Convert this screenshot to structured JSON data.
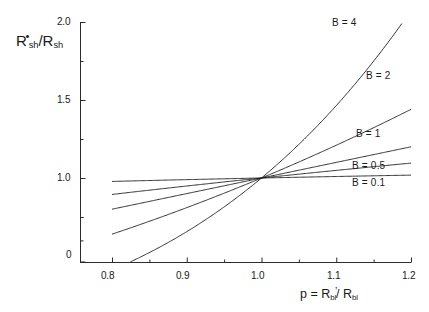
{
  "chart_data": {
    "type": "line",
    "title": "",
    "subtitle": "",
    "xlabel": "p = R'bl / Rbl",
    "ylabel": "R*sh / Rsh",
    "xlim": [
      0.8,
      1.2
    ],
    "ylim": [
      0.0,
      2.0
    ],
    "grid": false,
    "legend_position": "inline-right-of-curves",
    "x_ticks_major": [
      "0.8",
      "0.9",
      "1.0",
      "1.1",
      "1.2"
    ],
    "x_tick_values": [
      0.8,
      0.9,
      1.0,
      1.1,
      1.2
    ],
    "x_minor_ticks": [
      0.85,
      0.95,
      1.05,
      1.15
    ],
    "y_ticks_major": [
      "0",
      "1.0",
      "1.5",
      "2.0"
    ],
    "y_tick_values": [
      0.48,
      1.0,
      1.5,
      2.0
    ],
    "y_minor_ticks": [
      0.75,
      1.25,
      1.75
    ],
    "crossing_point": {
      "x": 1.0,
      "y": 1.0
    },
    "series": [
      {
        "name": "B = 0.1",
        "exponent": 0.1,
        "label": "B = 0.1",
        "x": [
          0.8,
          0.85,
          0.9,
          0.95,
          1.0,
          1.05,
          1.1,
          1.15,
          1.2
        ],
        "values": [
          0.978,
          0.984,
          0.99,
          0.995,
          1.0,
          1.005,
          1.01,
          1.014,
          1.018
        ]
      },
      {
        "name": "B = 0.5",
        "exponent": 0.5,
        "label": "B = 0.5",
        "x": [
          0.8,
          0.85,
          0.9,
          0.95,
          1.0,
          1.05,
          1.1,
          1.15,
          1.2
        ],
        "values": [
          0.894,
          0.922,
          0.949,
          0.975,
          1.0,
          1.025,
          1.049,
          1.072,
          1.095
        ]
      },
      {
        "name": "B = 1",
        "exponent": 1.0,
        "label": "B = 1",
        "x": [
          0.8,
          0.85,
          0.9,
          0.95,
          1.0,
          1.05,
          1.1,
          1.15,
          1.2
        ],
        "values": [
          0.8,
          0.85,
          0.9,
          0.95,
          1.0,
          1.05,
          1.1,
          1.15,
          1.2
        ]
      },
      {
        "name": "B = 2",
        "exponent": 2.0,
        "label": "B = 2",
        "x": [
          0.8,
          0.85,
          0.9,
          0.95,
          1.0,
          1.05,
          1.1,
          1.15,
          1.2
        ],
        "values": [
          0.64,
          0.723,
          0.81,
          0.903,
          1.0,
          1.103,
          1.21,
          1.323,
          1.44
        ]
      },
      {
        "name": "B = 4",
        "exponent": 4.0,
        "label": "B = 4",
        "x": [
          0.8,
          0.85,
          0.9,
          0.95,
          1.0,
          1.05,
          1.1,
          1.108
        ],
        "values": [
          0.41,
          0.522,
          0.656,
          0.815,
          1.0,
          1.216,
          1.464,
          1.96
        ]
      }
    ]
  },
  "axis": {
    "y_label_parts": {
      "r1": "R",
      "dot": "•",
      "sub1": "sh",
      "slash": "/",
      "r2": "R",
      "sub2": "sh"
    },
    "x_label_parts": {
      "p": "p",
      "eq": "=",
      "r1": "R",
      "prime": "’",
      "sub1": "bl",
      "slash": "/",
      "r2": "R",
      "sub2": "bl"
    }
  }
}
